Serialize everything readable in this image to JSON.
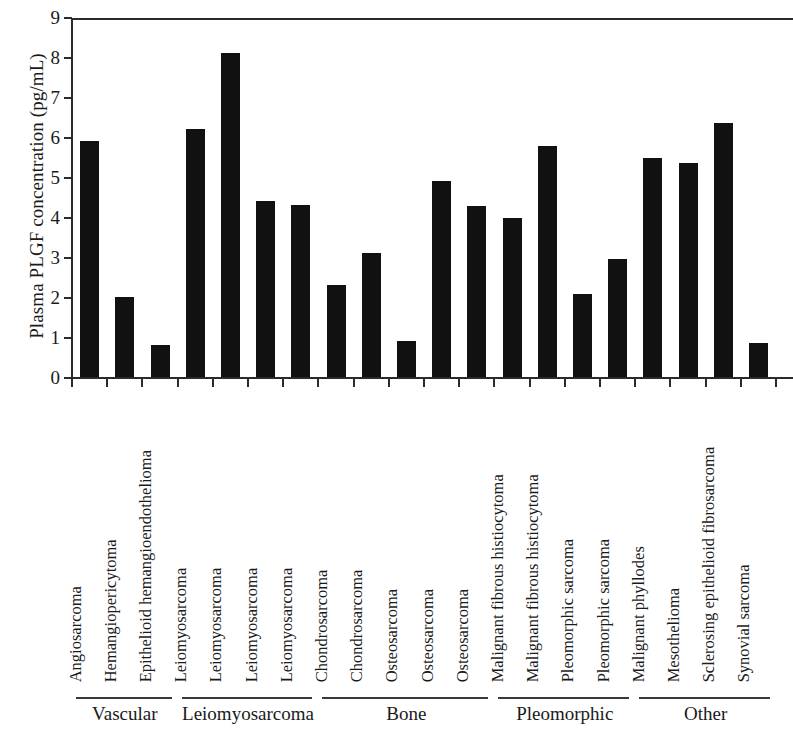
{
  "chart_data": {
    "type": "bar",
    "title": "",
    "subtitle": "",
    "xlabel": "",
    "ylabel": "Plasma PLGF concentration (pg/mL)",
    "ylim": [
      0,
      9
    ],
    "ytick_labels": [
      "0",
      "1",
      "2",
      "3",
      "4",
      "5",
      "6",
      "7",
      "8",
      "9"
    ],
    "ytick_values": [
      0,
      1,
      2,
      3,
      4,
      5,
      6,
      7,
      8,
      9
    ],
    "grid": false,
    "legend": null,
    "bar_color": "#111111",
    "axis_color": "#2b2b2b",
    "categories": [
      "Angiosarcoma",
      "Hemangiopericytoma",
      "Epithelioid hemangioendothelioma",
      "Leiomyosarcoma",
      "Leiomyosarcoma",
      "Leiomyosarcoma",
      "Leiomyosarcoma",
      "Chondrosarcoma",
      "Chondrosarcoma",
      "Osteosarcoma",
      "Osteosarcoma",
      "Osteosarcoma",
      "Malignant fibrous histiocytoma",
      "Malignant fibrous histiocytoma",
      "Pleomorphic sarcoma",
      "Pleomorphic sarcoma",
      "Malignant phyllodes",
      "Mesothelioma",
      "Sclerosing epithelioid fibrosarcoma",
      "Synovial sarcoma"
    ],
    "values": [
      5.9,
      2.0,
      0.8,
      6.2,
      8.1,
      4.4,
      4.3,
      2.3,
      3.1,
      0.9,
      4.9,
      4.27,
      3.97,
      5.77,
      2.07,
      2.95,
      5.47,
      5.35,
      6.35,
      0.85
    ],
    "groups": [
      {
        "label": "Vascular",
        "start_index": 0,
        "end_index": 2
      },
      {
        "label": "Leiomyosarcoma",
        "start_index": 3,
        "end_index": 6
      },
      {
        "label": "Bone",
        "start_index": 7,
        "end_index": 11
      },
      {
        "label": "Pleomorphic",
        "start_index": 12,
        "end_index": 15
      },
      {
        "label": "Other",
        "start_index": 16,
        "end_index": 19
      }
    ]
  }
}
